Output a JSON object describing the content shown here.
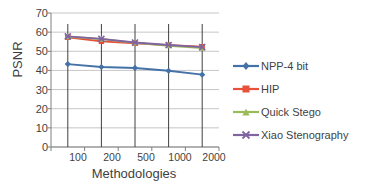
{
  "chart_data": {
    "type": "line",
    "title": "",
    "xlabel": "Methodologies",
    "ylabel": "PSNR",
    "categories": [
      "100",
      "200",
      "500",
      "1000",
      "2000"
    ],
    "ylim": [
      0,
      70
    ],
    "yticks": [
      0,
      10,
      20,
      30,
      40,
      50,
      60,
      70
    ],
    "grid": true,
    "legend_position": "right",
    "series": [
      {
        "name": "NPP-4 bit",
        "color": "#4472a8",
        "marker": "diamond",
        "values": [
          43.3,
          41.8,
          41.3,
          39.8,
          37.8
        ]
      },
      {
        "name": "HIP",
        "color": "#e8503a",
        "marker": "square",
        "values": [
          57.3,
          55.2,
          54.2,
          53.2,
          52.4
        ]
      },
      {
        "name": "Quick Stego",
        "color": "#9bbb59",
        "marker": "triangle",
        "values": [
          57.6,
          56.4,
          54.4,
          52.9,
          51.7
        ]
      },
      {
        "name": "Xiao Stenography",
        "color": "#8064a2",
        "marker": "x",
        "values": [
          57.8,
          56.5,
          54.6,
          53.3,
          52.2
        ]
      }
    ]
  },
  "legend": {
    "items": [
      {
        "label": "NPP-4 bit"
      },
      {
        "label": "HIP"
      },
      {
        "label": "Quick Stego"
      },
      {
        "label": "Xiao Stenography"
      }
    ]
  },
  "axes": {
    "y_title": "PSNR",
    "x_title": "Methodologies",
    "y_tick_labels": [
      "70",
      "60",
      "50",
      "40",
      "30",
      "20",
      "10",
      "0"
    ],
    "x_tick_labels": [
      "100",
      "200",
      "500",
      "1000",
      "2000"
    ]
  },
  "colors": {
    "series_1": "#4472a8",
    "series_2": "#e8503a",
    "series_3": "#9bbb59",
    "series_4": "#8064a2",
    "grid": "#b8b8b8",
    "axis": "#808080",
    "text": "#3f3f3f",
    "background": "#ffffff"
  }
}
